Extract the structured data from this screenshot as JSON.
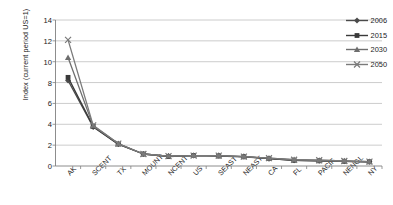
{
  "chart_data": {
    "type": "line",
    "title": "",
    "xlabel": "",
    "ylabel": "Index (current period US=1)",
    "ylim": [
      0,
      14
    ],
    "yticks": [
      0,
      2,
      4,
      6,
      8,
      10,
      12,
      14
    ],
    "grid": true,
    "legend_position": "top-right-inside",
    "categories": [
      "AK",
      "SCENT",
      "TX",
      "MOUNT",
      "NCENT",
      "US",
      "SEAST",
      "NEAST",
      "CA",
      "FL",
      "PACIF",
      "NENGL",
      "NY"
    ],
    "series": [
      {
        "name": "2006",
        "marker": "diamond",
        "color": "#4a4a4a",
        "values": [
          8.2,
          3.75,
          2.1,
          1.15,
          0.95,
          1.0,
          1.0,
          0.9,
          0.7,
          0.55,
          0.5,
          0.45,
          0.4
        ]
      },
      {
        "name": "2015",
        "marker": "square",
        "color": "#3a3a3a",
        "values": [
          8.5,
          3.8,
          2.1,
          1.15,
          0.9,
          1.0,
          0.95,
          0.88,
          0.72,
          0.55,
          0.5,
          0.45,
          0.4
        ]
      },
      {
        "name": "2030",
        "marker": "triangle",
        "color": "#6e6e6e",
        "values": [
          10.4,
          3.85,
          2.15,
          1.15,
          0.95,
          1.0,
          1.0,
          0.9,
          0.75,
          0.6,
          0.55,
          0.48,
          0.42
        ]
      },
      {
        "name": "2050",
        "marker": "cross",
        "color": "#7a7a7a",
        "values": [
          12.1,
          3.9,
          2.15,
          1.15,
          0.95,
          1.0,
          1.0,
          0.9,
          0.75,
          0.6,
          0.55,
          0.48,
          0.42
        ]
      }
    ]
  },
  "legend": {
    "items": [
      {
        "label": "2006"
      },
      {
        "label": "2015"
      },
      {
        "label": "2030"
      },
      {
        "label": "2050"
      }
    ]
  },
  "colors": {
    "grid": "#bfbfbf",
    "axis": "#808080",
    "text": "#1a1a1a",
    "background": "#ffffff"
  }
}
